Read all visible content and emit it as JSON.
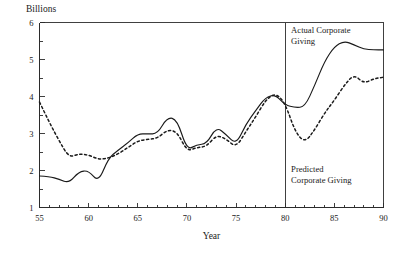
{
  "chart_data": {
    "type": "line",
    "title": "",
    "ylabel": "Billions",
    "xlabel": "Year",
    "xlim": [
      55,
      90
    ],
    "ylim": [
      1,
      6
    ],
    "grid": false,
    "legend_position": "inline-annotation",
    "x_ticks_major": [
      55,
      60,
      65,
      70,
      75,
      80,
      85,
      90
    ],
    "x_tick_labels": [
      "55",
      "60",
      "65",
      "70",
      "75",
      "80",
      "85",
      "90"
    ],
    "x_minor_tick_step": 1,
    "y_ticks": [
      1,
      2,
      3,
      4,
      5,
      6
    ],
    "y_tick_labels": [
      "1",
      "2",
      "3",
      "4",
      "5",
      "6"
    ],
    "annotations": [
      {
        "name": "actual-label",
        "text_line1": "Actual Corporate",
        "text_line2": "Giving",
        "x": 80.6,
        "y": 5.72
      },
      {
        "name": "predicted-label",
        "text_line1": "Predicted",
        "text_line2": "Corporate Giving",
        "x": 80.6,
        "y": 1.95
      },
      {
        "name": "forecast-divider",
        "type": "vline",
        "x": 80
      }
    ],
    "x": [
      55,
      56,
      57,
      58,
      59,
      60,
      61,
      62,
      63,
      64,
      65,
      66,
      67,
      68,
      69,
      70,
      71,
      72,
      73,
      74,
      75,
      76,
      77,
      78,
      79,
      80,
      81,
      82,
      83,
      84,
      85,
      86,
      87,
      88,
      89,
      90
    ],
    "series": [
      {
        "name": "Actual Corporate Giving",
        "style": "solid",
        "values": [
          1.85,
          1.84,
          1.76,
          1.66,
          1.97,
          2.0,
          1.68,
          2.33,
          2.55,
          2.75,
          2.99,
          2.99,
          2.99,
          3.44,
          3.38,
          2.55,
          2.7,
          2.72,
          3.18,
          2.97,
          2.7,
          3.25,
          3.62,
          3.98,
          4.05,
          3.77,
          3.7,
          3.72,
          4.3,
          4.95,
          5.35,
          5.5,
          5.4,
          5.28,
          5.26,
          5.26
        ]
      },
      {
        "name": "Predicted Corporate Giving",
        "style": "dotted",
        "values": [
          3.85,
          3.3,
          2.8,
          2.35,
          2.45,
          2.42,
          2.3,
          2.33,
          2.45,
          2.62,
          2.8,
          2.84,
          2.87,
          3.1,
          3.05,
          2.52,
          2.62,
          2.65,
          2.96,
          2.85,
          2.62,
          3.05,
          3.45,
          3.9,
          4.1,
          3.82,
          3.05,
          2.75,
          3.1,
          3.55,
          3.9,
          4.3,
          4.6,
          4.35,
          4.48,
          4.52
        ]
      }
    ]
  }
}
